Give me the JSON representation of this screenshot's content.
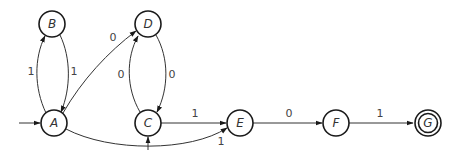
{
  "diagram": {
    "type": "finite-state-automaton",
    "start_states": [
      "A",
      "C"
    ],
    "accepting_states": [
      "G"
    ],
    "states": [
      {
        "id": "A",
        "label": "A"
      },
      {
        "id": "B",
        "label": "B"
      },
      {
        "id": "C",
        "label": "C"
      },
      {
        "id": "D",
        "label": "D"
      },
      {
        "id": "E",
        "label": "E"
      },
      {
        "id": "F",
        "label": "F"
      },
      {
        "id": "G",
        "label": "G"
      }
    ],
    "transitions": [
      {
        "from": "A",
        "to": "B",
        "label": "1"
      },
      {
        "from": "B",
        "to": "A",
        "label": "1"
      },
      {
        "from": "A",
        "to": "D",
        "label": "0"
      },
      {
        "from": "C",
        "to": "D",
        "label": "0"
      },
      {
        "from": "D",
        "to": "C",
        "label": "0"
      },
      {
        "from": "C",
        "to": "E",
        "label": "1"
      },
      {
        "from": "A",
        "to": "E",
        "label": "1"
      },
      {
        "from": "E",
        "to": "F",
        "label": "0"
      },
      {
        "from": "F",
        "to": "G",
        "label": "1"
      }
    ]
  }
}
